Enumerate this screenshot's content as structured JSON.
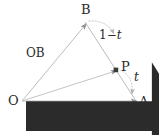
{
  "figure": {
    "type": "vector-geometry-diagram",
    "stroke_color": "#b9b9b9",
    "text_color": "#2b2b2b",
    "arc_color": "#bdbdbd",
    "background": "#ffffff"
  },
  "points": {
    "O": {
      "label": "O",
      "x": 22,
      "y": 101
    },
    "A": {
      "label": "A",
      "x": 136,
      "y": 101
    },
    "B": {
      "label": "B",
      "x": 85,
      "y": 22
    },
    "P": {
      "label": "P",
      "x": 116,
      "y": 70
    }
  },
  "vectors": {
    "OA": {
      "label": "OA",
      "from": "O",
      "to": "A"
    },
    "OB": {
      "label": "OB",
      "from": "O",
      "to": "B"
    },
    "OP": {
      "from": "O",
      "to": "P"
    }
  },
  "segments": {
    "BA": {
      "from": "B",
      "to": "A"
    }
  },
  "parameters": {
    "upper": {
      "label": "1 − t",
      "number": "1",
      "operator": "−",
      "variable": "t"
    },
    "lower": {
      "label": "t",
      "variable": "t"
    }
  }
}
